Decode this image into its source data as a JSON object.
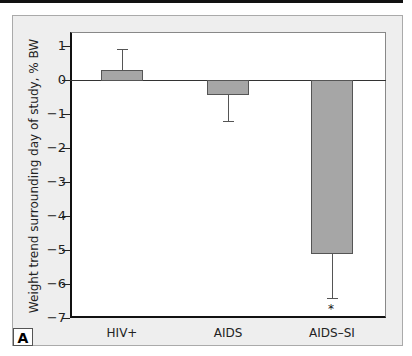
{
  "chart_data": {
    "type": "bar",
    "title": "",
    "panel_label": "A",
    "xlabel": "",
    "ylabel": "Weight trend surrounding day of study, % BW",
    "categories": [
      "HIV+",
      "AIDS",
      "AIDS–SI"
    ],
    "values": [
      0.3,
      -0.45,
      -5.1
    ],
    "error_bars": [
      0.6,
      0.75,
      1.3
    ],
    "error_direction": [
      "up",
      "down",
      "down"
    ],
    "significance": [
      "",
      "",
      "*"
    ],
    "ylim": [
      -7,
      1.5
    ],
    "yticks": [
      1,
      0,
      -1,
      -2,
      -3,
      -4,
      -5,
      -6,
      -7
    ],
    "ytick_labels": [
      "1",
      "0",
      "−1",
      "−2",
      "−3",
      "−4",
      "−5",
      "−6",
      "−7"
    ],
    "grid": false,
    "bar_color": "#a6a6a6"
  }
}
